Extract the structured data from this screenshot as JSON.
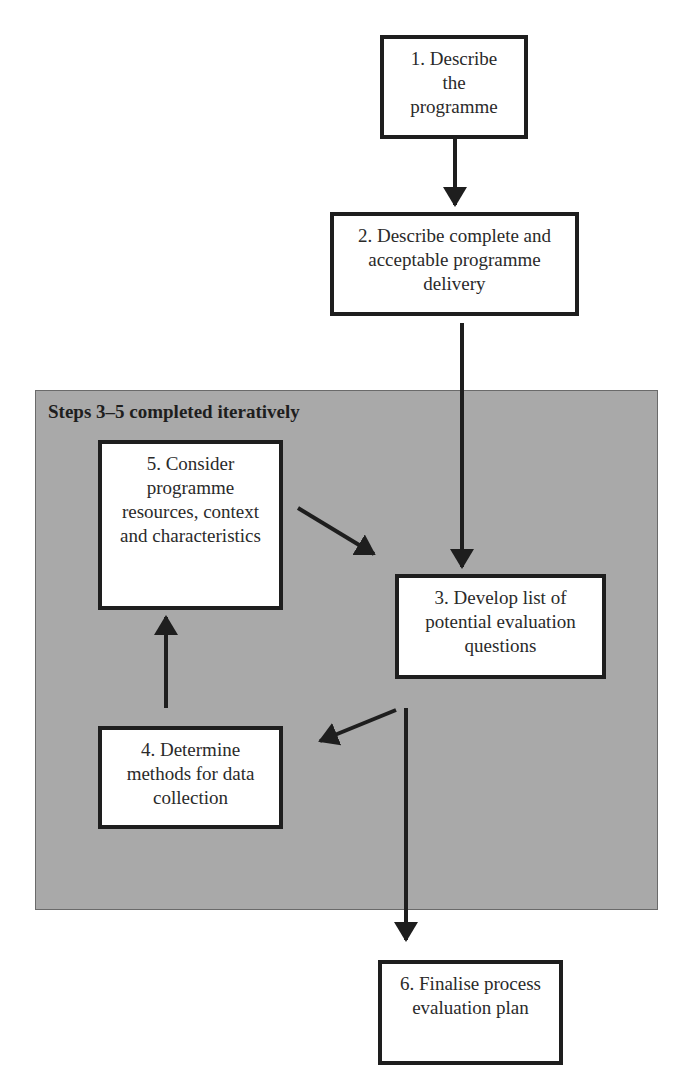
{
  "diagram": {
    "type": "flowchart",
    "group": {
      "label": "Steps 3–5 completed iteratively",
      "fill": "#a9a9a9"
    },
    "steps": [
      {
        "id": 1,
        "lines": [
          "1. Describe",
          "the",
          "programme"
        ]
      },
      {
        "id": 2,
        "lines": [
          "2. Describe complete and",
          "acceptable programme",
          "delivery"
        ]
      },
      {
        "id": 3,
        "lines": [
          "3. Develop list of",
          "potential evaluation",
          "questions"
        ]
      },
      {
        "id": 4,
        "lines": [
          "4. Determine",
          "methods for data",
          "collection"
        ]
      },
      {
        "id": 5,
        "lines": [
          "5. Consider",
          "programme",
          "resources, context",
          "and characteristics"
        ]
      },
      {
        "id": 6,
        "lines": [
          "6. Finalise process",
          "evaluation plan"
        ]
      }
    ],
    "edges": [
      {
        "from": 1,
        "to": 2
      },
      {
        "from": 2,
        "to": 3
      },
      {
        "from": 3,
        "to": 4
      },
      {
        "from": 4,
        "to": 5
      },
      {
        "from": 5,
        "to": 3
      },
      {
        "from": 3,
        "to": 6
      }
    ]
  }
}
